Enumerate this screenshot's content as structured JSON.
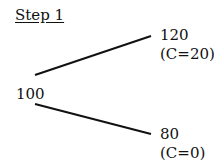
{
  "title": "Step 1",
  "root": {
    "value": "100"
  },
  "up": {
    "value": "120",
    "payoff": "(C=20)"
  },
  "down": {
    "value": "80",
    "payoff": "(C=0)"
  },
  "line_color": "#111111"
}
